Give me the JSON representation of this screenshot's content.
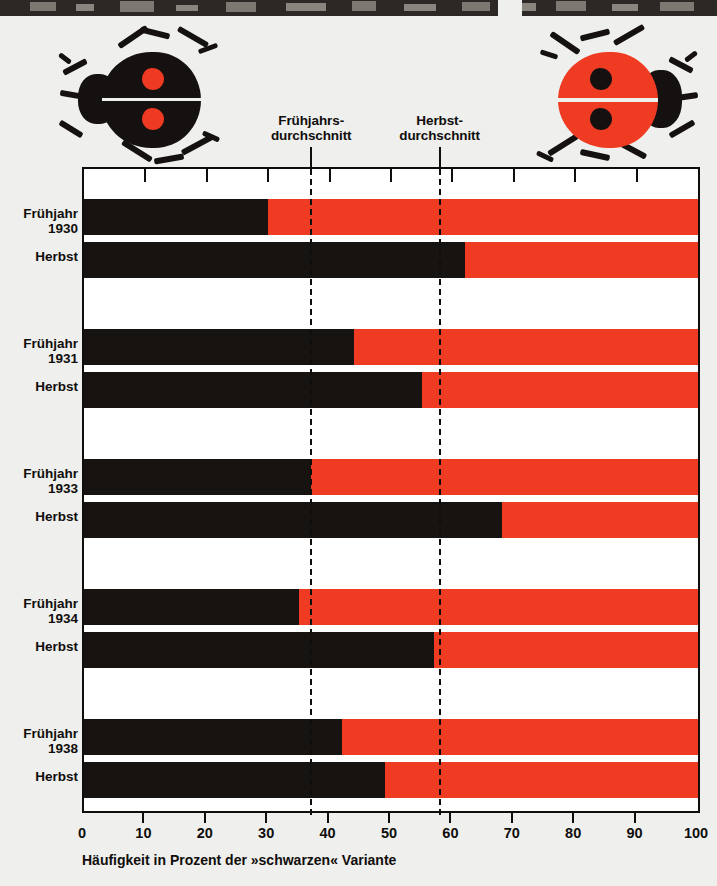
{
  "figure": {
    "background_color": "#efefed",
    "black_color": "#171311",
    "red_color": "#f03b23"
  },
  "illustrations": {
    "left_bug": {
      "name": "black-variant-ladybird",
      "body_color": "#141110",
      "spot_color": "#ee3a22",
      "spots": 2
    },
    "right_bug": {
      "name": "red-variant-ladybird",
      "body_color": "#f03b23",
      "spot_color": "#141110",
      "spots": 2
    }
  },
  "annotations": [
    {
      "id": "spring-average",
      "line1": "Frühjahrs-",
      "line2": "durchschnitt",
      "value": 37
    },
    {
      "id": "autumn-average",
      "line1": "Herbst-",
      "line2": "durchschnitt",
      "value": 58
    }
  ],
  "chart_data": {
    "type": "bar",
    "orientation": "horizontal",
    "title": "",
    "xlabel": "Häufigkeit in Prozent der »schwarzen« Variante",
    "ylabel": "",
    "xlim": [
      0,
      100
    ],
    "xticks": [
      0,
      10,
      20,
      30,
      40,
      50,
      60,
      70,
      80,
      90,
      100
    ],
    "xticklabels": [
      "0",
      "10",
      "20",
      "30",
      "40",
      "50",
      "60",
      "70",
      "80",
      "90",
      "100"
    ],
    "grid": false,
    "legend": "none",
    "stacked": true,
    "series": [
      {
        "name": "schwarz",
        "color": "#171311"
      },
      {
        "name": "rot",
        "color": "#f03b23"
      }
    ],
    "groups": [
      {
        "year": "1930",
        "rows": [
          {
            "season": "Frühjahr",
            "black": 30,
            "red": 70
          },
          {
            "season": "Herbst",
            "black": 62,
            "red": 38
          }
        ]
      },
      {
        "year": "1931",
        "rows": [
          {
            "season": "Frühjahr",
            "black": 44,
            "red": 56
          },
          {
            "season": "Herbst",
            "black": 55,
            "red": 45
          }
        ]
      },
      {
        "year": "1933",
        "rows": [
          {
            "season": "Frühjahr",
            "black": 37,
            "red": 63
          },
          {
            "season": "Herbst",
            "black": 68,
            "red": 32
          }
        ]
      },
      {
        "year": "1934",
        "rows": [
          {
            "season": "Frühjahr",
            "black": 35,
            "red": 65
          },
          {
            "season": "Herbst",
            "black": 57,
            "red": 43
          }
        ]
      },
      {
        "year": "1938",
        "rows": [
          {
            "season": "Frühjahr",
            "black": 42,
            "red": 58
          },
          {
            "season": "Herbst",
            "black": 49,
            "red": 51
          }
        ]
      }
    ],
    "reference_lines": [
      {
        "label": "Frühjahrsdurchschnitt",
        "value": 37
      },
      {
        "label": "Herbstdurchschnitt",
        "value": 58
      }
    ]
  }
}
